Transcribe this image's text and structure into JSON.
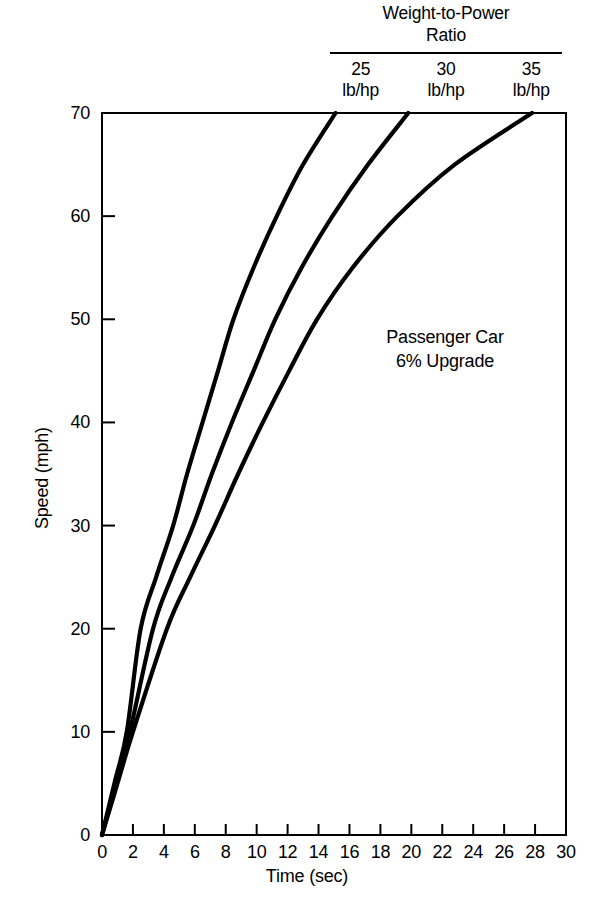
{
  "legend": {
    "title": "Weight-to-Power\nRatio",
    "columns": [
      {
        "value": "25",
        "unit": "lb/hp"
      },
      {
        "value": "30",
        "unit": "lb/hp"
      },
      {
        "value": "35",
        "unit": "lb/hp"
      }
    ]
  },
  "annotation": {
    "text": "Passenger Car\n6% Upgrade"
  },
  "axes": {
    "x_title": "Time (sec)",
    "y_title": "Speed (mph)",
    "x_ticks": [
      "0",
      "2",
      "4",
      "6",
      "8",
      "10",
      "12",
      "14",
      "16",
      "18",
      "20",
      "22",
      "24",
      "26",
      "28",
      "30"
    ],
    "y_ticks": [
      "0",
      "10",
      "20",
      "30",
      "40",
      "50",
      "60",
      "70"
    ]
  },
  "chart_data": {
    "type": "line",
    "title": "Passenger Car 6% Upgrade",
    "subtitle": "Weight-to-Power Ratio",
    "xlabel": "Time (sec)",
    "ylabel": "Speed (mph)",
    "xlim": [
      0,
      30
    ],
    "ylim": [
      0,
      70
    ],
    "xticks": [
      0,
      2,
      4,
      6,
      8,
      10,
      12,
      14,
      16,
      18,
      20,
      22,
      24,
      26,
      28,
      30
    ],
    "yticks": [
      0,
      10,
      20,
      30,
      40,
      50,
      60,
      70
    ],
    "grid": false,
    "legend_position": "top-right",
    "annotations": [
      "Passenger Car",
      "6% Upgrade"
    ],
    "series": [
      {
        "name": "25 lb/hp",
        "points": [
          [
            0.0,
            0
          ],
          [
            0.8,
            5
          ],
          [
            1.6,
            10
          ],
          [
            2.5,
            20
          ],
          [
            3.5,
            25
          ],
          [
            4.6,
            30
          ],
          [
            5.5,
            35
          ],
          [
            6.5,
            40
          ],
          [
            7.5,
            45
          ],
          [
            8.5,
            50
          ],
          [
            9.8,
            55
          ],
          [
            11.3,
            60
          ],
          [
            13.0,
            65
          ],
          [
            15.1,
            70
          ]
        ]
      },
      {
        "name": "30 lb/hp",
        "points": [
          [
            0.0,
            0
          ],
          [
            0.9,
            5
          ],
          [
            1.8,
            10
          ],
          [
            3.3,
            20
          ],
          [
            4.5,
            25
          ],
          [
            5.9,
            30
          ],
          [
            7.1,
            35
          ],
          [
            8.4,
            40
          ],
          [
            9.8,
            45
          ],
          [
            11.2,
            50
          ],
          [
            12.9,
            55
          ],
          [
            14.9,
            60
          ],
          [
            17.2,
            65
          ],
          [
            19.8,
            70
          ]
        ]
      },
      {
        "name": "35 lb/hp",
        "points": [
          [
            0.0,
            0
          ],
          [
            1.0,
            5
          ],
          [
            2.0,
            10
          ],
          [
            4.2,
            20
          ],
          [
            5.7,
            25
          ],
          [
            7.3,
            30
          ],
          [
            8.8,
            35
          ],
          [
            10.4,
            40
          ],
          [
            12.1,
            45
          ],
          [
            13.9,
            50
          ],
          [
            16.2,
            55
          ],
          [
            19.1,
            60
          ],
          [
            22.8,
            65
          ],
          [
            27.8,
            70
          ]
        ]
      }
    ]
  }
}
